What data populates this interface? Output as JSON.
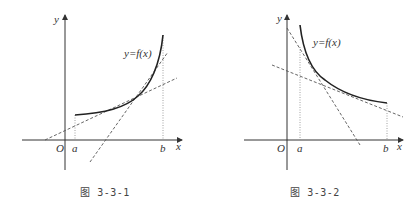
{
  "figures": [
    {
      "id": "fig-3-3-1",
      "caption": "图 3-3-1",
      "curve_label": "y=f(x)",
      "axis_x_label": "x",
      "axis_y_label": "y",
      "origin_label": "O",
      "point_a_label": "a",
      "point_b_label": "b",
      "description": "Increasing convex curve on [a,b] with two dashed tangent/secant lines"
    },
    {
      "id": "fig-3-3-2",
      "caption": "图 3-3-2",
      "curve_label": "y=f(x)",
      "axis_x_label": "x",
      "axis_y_label": "y",
      "origin_label": "O",
      "point_a_label": "a",
      "point_b_label": "b",
      "description": "Decreasing convex curve on [a,b] with two dashed tangent lines"
    }
  ],
  "colors": {
    "axis": "#333333",
    "curve": "#222222",
    "dashed": "#555555",
    "dotted": "#888888"
  }
}
